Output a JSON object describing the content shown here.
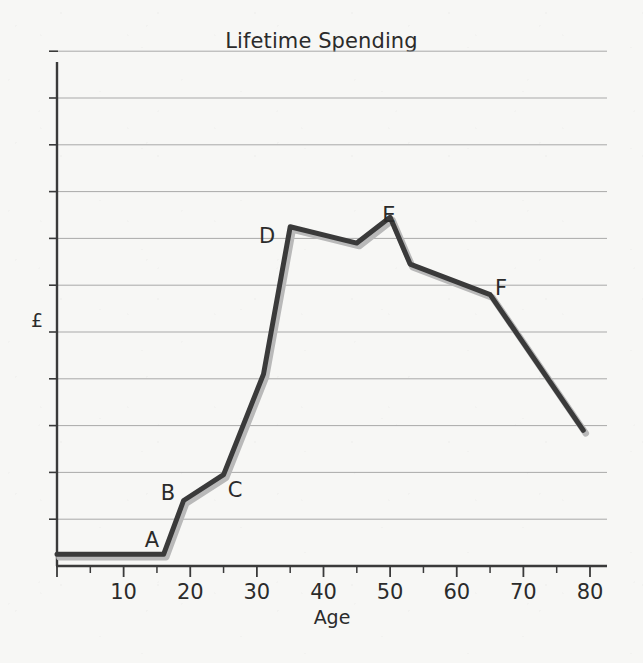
{
  "chart_data": {
    "type": "line",
    "title": "Lifetime Spending",
    "xlabel": "Age",
    "ylabel": "£",
    "xlim": [
      0,
      82
    ],
    "ylim": [
      0,
      11
    ],
    "grid": true,
    "legend": "none",
    "x_ticks": [
      10,
      20,
      30,
      40,
      50,
      60,
      70,
      80
    ],
    "x_tick_labels": [
      "10",
      "20",
      "30",
      "40",
      "50",
      "60",
      "70",
      "80"
    ],
    "x_minor_ticks": [
      5,
      15,
      25,
      35,
      45,
      55,
      65,
      75
    ],
    "y_ticks": [
      1,
      2,
      3,
      4,
      5,
      6,
      7,
      8,
      9,
      10,
      11
    ],
    "y_tick_labels": [
      "",
      "",
      "",
      "",
      "",
      "",
      "",
      "",
      "",
      "",
      ""
    ],
    "series": [
      {
        "name": "Lifetime Spending",
        "x": [
          0,
          16,
          19,
          25,
          31,
          35,
          45,
          50,
          53,
          65,
          79
        ],
        "y": [
          0.25,
          0.25,
          1.4,
          1.95,
          4.1,
          7.25,
          6.9,
          7.45,
          6.45,
          5.8,
          2.9
        ]
      }
    ],
    "annotations": [
      {
        "label": "A",
        "x": 16,
        "y": 0.25,
        "label_x": 152,
        "label_y": 547
      },
      {
        "label": "B",
        "x": 19,
        "y": 1.4,
        "label_x": 168,
        "label_y": 500
      },
      {
        "label": "C",
        "x": 25,
        "y": 1.95,
        "label_x": 235,
        "label_y": 497
      },
      {
        "label": "D",
        "x": 35,
        "y": 7.25,
        "label_x": 267,
        "label_y": 243
      },
      {
        "label": "E",
        "x": 50,
        "y": 7.45,
        "label_x": 389,
        "label_y": 222
      },
      {
        "label": "F",
        "x": 65,
        "y": 5.8,
        "label_x": 501,
        "label_y": 295
      }
    ],
    "colors": {
      "line": "#3a3a3a",
      "line_shadow": "#b9b9b9",
      "grid": "#a9a9a9",
      "axis": "#3a3a3a",
      "background": "#f7f7f5",
      "text": "#2b2b2b"
    }
  }
}
